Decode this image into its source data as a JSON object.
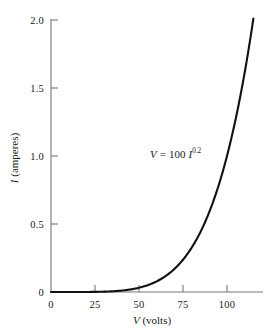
{
  "chart_data": {
    "type": "line",
    "title": "",
    "subtitle": "",
    "xlabel_var": "V",
    "xlabel_unit": "(volts)",
    "ylabel_var": "I",
    "ylabel_unit": "(amperes)",
    "xlim": [
      0,
      118
    ],
    "ylim": [
      0,
      2.08
    ],
    "xticks": [
      0,
      25,
      50,
      75,
      100
    ],
    "xtick_labels": [
      "0",
      "25",
      "50",
      "75",
      "100"
    ],
    "yticks": [
      0,
      0.5,
      1.0,
      1.5,
      2.0
    ],
    "ytick_labels": [
      "0",
      "0.5",
      "1.0",
      "1.5",
      "2.0"
    ],
    "grid": false,
    "legend": "none",
    "annotations": [
      {
        "text": "V = 100 I^0.2",
        "lhs": "V",
        "equals": "=",
        "coefficient": "100",
        "base": "I",
        "exponent": "0.2",
        "x": 62,
        "y": 1.0
      }
    ],
    "series": [
      {
        "name": "V = 100 I^0.2",
        "relation": "I = (V/100)^5",
        "color": "#111111",
        "linewidth": 2.1,
        "x": [
          0,
          5,
          10,
          15,
          20,
          25,
          30,
          35,
          40,
          45,
          50,
          55,
          60,
          65,
          70,
          75,
          80,
          85,
          90,
          95,
          100,
          105,
          110,
          115,
          118
        ],
        "y": [
          0.0,
          0.0,
          0.0,
          0.0001,
          0.0003,
          0.001,
          0.0024,
          0.0053,
          0.0102,
          0.0185,
          0.0313,
          0.0503,
          0.0778,
          0.116,
          0.1681,
          0.2373,
          0.3277,
          0.4437,
          0.5905,
          0.7738,
          1.0,
          1.2763,
          1.6105,
          2.0114,
          2.2875
        ]
      }
    ]
  },
  "axes": {
    "line_color": "#777777",
    "tick_direction": "in",
    "spines": [
      "left",
      "bottom"
    ]
  }
}
